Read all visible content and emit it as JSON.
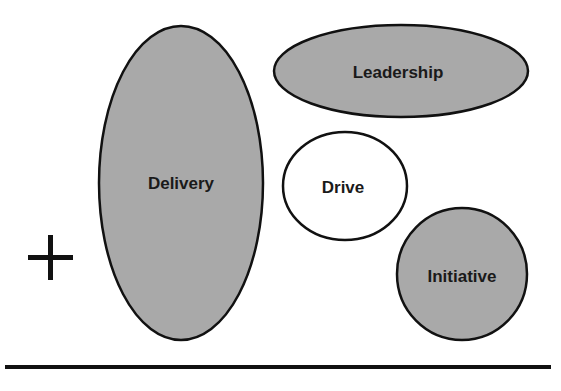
{
  "diagram": {
    "colors": {
      "fill_gray": "#a9a9a9",
      "fill_white": "#ffffff",
      "stroke": "#111111"
    },
    "shapes": [
      {
        "id": "delivery",
        "label": "Delivery",
        "fill": "gray"
      },
      {
        "id": "leadership",
        "label": "Leadership",
        "fill": "gray"
      },
      {
        "id": "drive",
        "label": "Drive",
        "fill": "white"
      },
      {
        "id": "initiative",
        "label": "Initiative",
        "fill": "gray"
      }
    ],
    "symbol": "plus"
  }
}
